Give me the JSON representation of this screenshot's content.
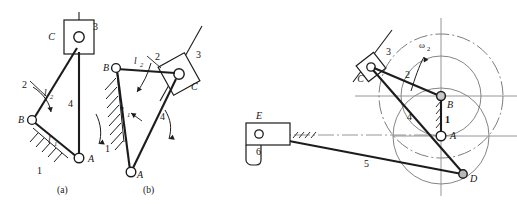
{
  "figure": {
    "kind": "mechanism-kinematic-diagrams",
    "panels": [
      {
        "id": "a",
        "caption": "(a)",
        "joints": [
          {
            "name": "C",
            "label": "C",
            "type": "pin-in-slider",
            "x": 70,
            "y": 36
          },
          {
            "name": "B",
            "label": "B",
            "type": "pin",
            "x": 32,
            "y": 120
          },
          {
            "name": "A",
            "label": "A",
            "type": "pin",
            "x": 78,
            "y": 158
          }
        ],
        "links": [
          {
            "number": "1",
            "label": "1",
            "role": "ground",
            "x": 40,
            "y": 170
          },
          {
            "number": "2",
            "label": "2",
            "role": "coupler",
            "x": 26,
            "y": 84
          },
          {
            "number": "3",
            "label": "3",
            "role": "slider",
            "x": 93,
            "y": 26
          },
          {
            "number": "4",
            "label": "4",
            "role": "rocker",
            "x": 71,
            "y": 104
          }
        ],
        "dimensions": [
          {
            "label": "l",
            "sub": "2",
            "x": 48,
            "y": 93
          },
          {
            "label": "l",
            "sub": "1",
            "x": 51,
            "y": 141
          }
        ]
      },
      {
        "id": "b",
        "caption": "(b)",
        "joints": [
          {
            "name": "B",
            "label": "B",
            "type": "pin",
            "x": 116,
            "y": 68
          },
          {
            "name": "C",
            "label": "C",
            "type": "pin-in-slider",
            "x": 178,
            "y": 74
          },
          {
            "name": "A",
            "label": "A",
            "type": "pin",
            "x": 131,
            "y": 172
          }
        ],
        "links": [
          {
            "number": "1",
            "label": "1",
            "role": "ground",
            "x": 111,
            "y": 147
          },
          {
            "number": "2",
            "label": "2",
            "role": "coupler",
            "x": 158,
            "y": 56
          },
          {
            "number": "3",
            "label": "3",
            "role": "slider",
            "x": 195,
            "y": 54
          },
          {
            "number": "4",
            "label": "4",
            "role": "rocker",
            "x": 163,
            "y": 116
          }
        ],
        "dimensions": [
          {
            "label": "l",
            "sub": "2",
            "x": 138,
            "y": 62
          },
          {
            "label": "l",
            "sub": "1",
            "x": 124,
            "y": 112
          }
        ]
      },
      {
        "id": "c",
        "caption": "",
        "joints": [
          {
            "name": "C",
            "label": "C",
            "type": "pin-in-slider",
            "x": 371,
            "y": 67
          },
          {
            "name": "B",
            "label": "B",
            "type": "pin",
            "x": 441,
            "y": 96
          },
          {
            "name": "A",
            "label": "A",
            "type": "pin",
            "x": 441,
            "y": 136
          },
          {
            "name": "D",
            "label": "D",
            "type": "pin",
            "x": 463,
            "y": 174
          },
          {
            "name": "E",
            "label": "E",
            "type": "pin-in-slider",
            "x": 259,
            "y": 134
          }
        ],
        "links": [
          {
            "number": "1",
            "label": "1",
            "role": "ground",
            "x": 446,
            "y": 117
          },
          {
            "number": "2",
            "label": "2",
            "role": "crank",
            "x": 409,
            "y": 74
          },
          {
            "number": "3",
            "label": "3",
            "role": "slider",
            "x": 388,
            "y": 52
          },
          {
            "number": "4",
            "label": "4",
            "role": "link",
            "x": 412,
            "y": 117
          },
          {
            "number": "5",
            "label": "5",
            "role": "link",
            "x": 368,
            "y": 163
          },
          {
            "number": "6",
            "label": "6",
            "role": "slider",
            "x": 260,
            "y": 150
          }
        ],
        "annotations": [
          {
            "label": "ω",
            "sub": "2",
            "x": 423,
            "y": 50,
            "kind": "angular-velocity"
          }
        ]
      }
    ]
  },
  "style": {
    "line": "#1c1c1c",
    "axis": "#7a7a7a",
    "circle": "#6e6e6e",
    "hatch": "#1c1c1c",
    "background": "#ffffff"
  }
}
